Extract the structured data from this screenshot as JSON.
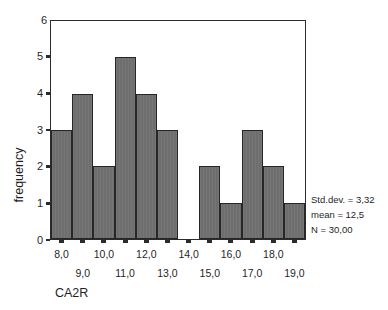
{
  "chart_data": {
    "type": "bar",
    "title": "",
    "subtitle": "",
    "xlabel": "CA2R",
    "ylabel": "frequency",
    "categories": [
      "8,0",
      "9,0",
      "10,0",
      "11,0",
      "12,0",
      "13,0",
      "14,0",
      "15,0",
      "16,0",
      "17,0",
      "18,0",
      "19,0"
    ],
    "values": [
      3,
      4,
      2,
      5,
      4,
      3,
      0,
      2,
      1,
      3,
      2,
      1
    ],
    "ylim": [
      0,
      6
    ],
    "yticks": [
      "0",
      "1",
      "2",
      "3",
      "4",
      "5",
      "6"
    ],
    "xtick_labels_upper": [
      "8,0",
      "",
      "10,0",
      "",
      "12,0",
      "",
      "14,0",
      "",
      "16,0",
      "",
      "18,0",
      ""
    ],
    "xtick_labels_lower": [
      "",
      "9,0",
      "",
      "11,0",
      "",
      "13,0",
      "",
      "15,0",
      "",
      "17,0",
      "",
      "19,0"
    ],
    "grid": false,
    "legend": null,
    "bar_color": "#6e6e6e",
    "bar_edge_color": "#262626",
    "axis_color": "#2b2b2b",
    "annotations": [
      "Std.dev. = 3,32",
      "mean = 12,5",
      "N = 30,00"
    ]
  },
  "stats": {
    "std_dev_label": "Std.dev. = 3,32",
    "mean_label": "mean = 12,5",
    "n_label": "N = 30,00"
  }
}
